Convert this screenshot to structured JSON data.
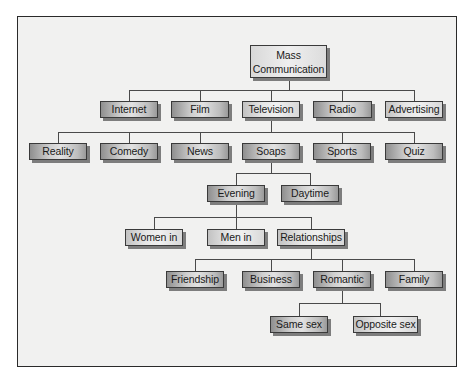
{
  "diagram": {
    "root": {
      "line1": "Mass",
      "line2": "Communication"
    },
    "level1": [
      "Internet",
      "Film",
      "Television",
      "Radio",
      "Advertising"
    ],
    "television_children": [
      "Reality",
      "Comedy",
      "News",
      "Soaps",
      "Sports",
      "Quiz"
    ],
    "soaps_children": [
      "Evening",
      "Daytime"
    ],
    "evening_children": [
      "Women in",
      "Men in",
      "Relationships"
    ],
    "relationships_children": [
      "Friendship",
      "Business",
      "Romantic",
      "Family"
    ],
    "romantic_children": [
      "Same sex",
      "Opposite sex"
    ]
  }
}
